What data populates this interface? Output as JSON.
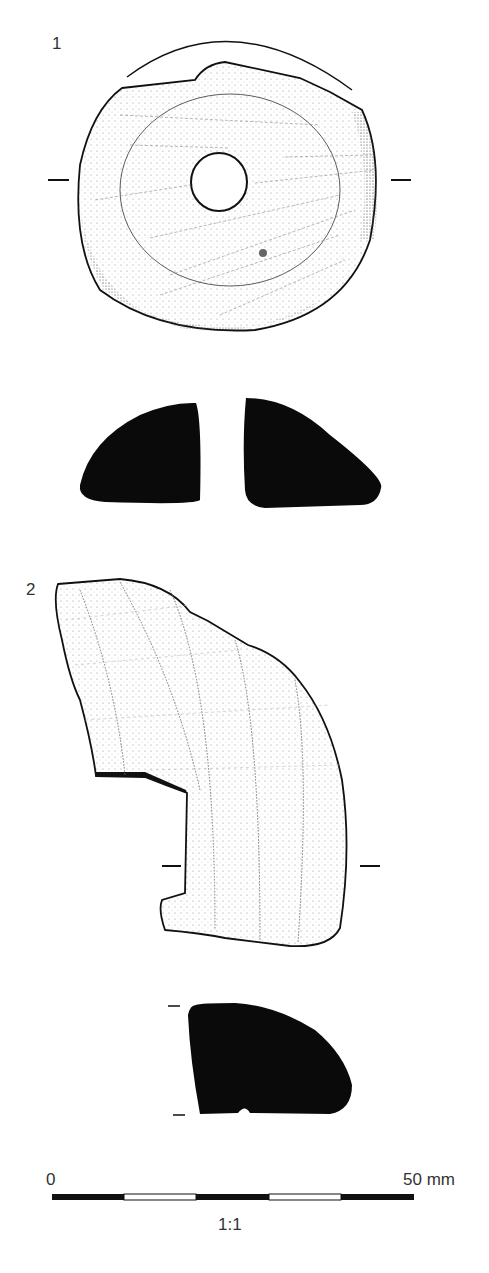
{
  "figure": {
    "objects": [
      {
        "number": "1",
        "views": [
          "plan-view",
          "section-view"
        ],
        "description": "circular perforated object with central hole"
      },
      {
        "number": "2",
        "views": [
          "plan-view",
          "section-view"
        ],
        "description": "fragmentary curved ring segment"
      }
    ],
    "scale_bar": {
      "start_label": "0",
      "end_label": "50 mm",
      "segments": 5,
      "segment_colors": [
        "#111111",
        "#ffffff",
        "#111111",
        "#ffffff",
        "#111111"
      ],
      "ratio_label": "1:1"
    },
    "colors": {
      "ink": "#111111",
      "stipple": "#555555",
      "background": "#ffffff"
    }
  }
}
